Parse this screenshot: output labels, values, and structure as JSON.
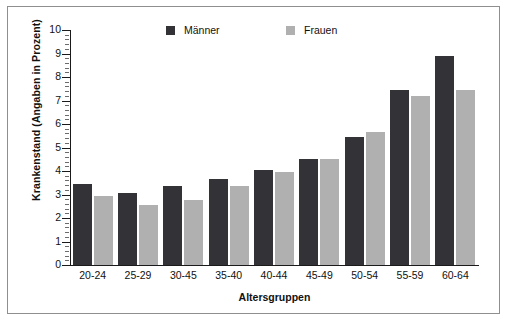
{
  "chart_data": {
    "type": "bar",
    "title": "",
    "xlabel": "Altersgruppen",
    "ylabel": "Krankenstand (Angaben in Prozent)",
    "categories": [
      "20-24",
      "25-29",
      "30-45",
      "35-40",
      "40-44",
      "45-49",
      "50-54",
      "55-59",
      "60-64"
    ],
    "series": [
      {
        "name": "Männer",
        "color": "#333337",
        "values": [
          3.45,
          3.05,
          3.35,
          3.65,
          4.05,
          4.5,
          5.45,
          7.45,
          8.9
        ]
      },
      {
        "name": "Frauen",
        "color": "#b0b0b0",
        "values": [
          2.95,
          2.55,
          2.75,
          3.35,
          3.95,
          4.5,
          5.65,
          7.2,
          7.45
        ]
      }
    ],
    "ylim": [
      0,
      10
    ],
    "ytick_labels": [
      "0",
      "1",
      "2",
      "3",
      "4",
      "5",
      "6",
      "7",
      "8",
      "9",
      "10"
    ],
    "ytick_values": [
      0,
      1,
      2,
      3,
      4,
      5,
      6,
      7,
      8,
      9,
      10
    ],
    "yminor_step": 0.2,
    "grid": false,
    "legend_position": "top-center"
  }
}
